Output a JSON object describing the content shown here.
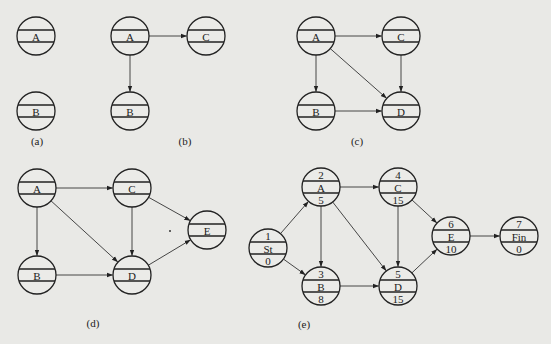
{
  "figures": [
    {
      "id": "a",
      "caption": "(a)",
      "nodes": [
        {
          "id": "A",
          "label": "A",
          "x": 36,
          "y": 36
        },
        {
          "id": "B",
          "label": "B",
          "x": 36,
          "y": 111
        }
      ],
      "edges": []
    },
    {
      "id": "b",
      "caption": "(b)",
      "nodes": [
        {
          "id": "A",
          "label": "A",
          "x": 130,
          "y": 36
        },
        {
          "id": "C",
          "label": "C",
          "x": 206,
          "y": 36
        },
        {
          "id": "B",
          "label": "B",
          "x": 130,
          "y": 111
        }
      ],
      "edges": [
        [
          "A",
          "C"
        ],
        [
          "A",
          "B"
        ]
      ]
    },
    {
      "id": "c",
      "caption": "(c)",
      "nodes": [
        {
          "id": "A",
          "label": "A",
          "x": 316,
          "y": 36
        },
        {
          "id": "C",
          "label": "C",
          "x": 401,
          "y": 36
        },
        {
          "id": "B",
          "label": "B",
          "x": 316,
          "y": 111
        },
        {
          "id": "D",
          "label": "D",
          "x": 401,
          "y": 111
        }
      ],
      "edges": [
        [
          "A",
          "C"
        ],
        [
          "A",
          "B"
        ],
        [
          "A",
          "D"
        ],
        [
          "B",
          "D"
        ],
        [
          "C",
          "D"
        ]
      ]
    },
    {
      "id": "d",
      "caption": "(d)",
      "nodes": [
        {
          "id": "A",
          "label": "A",
          "x": 37,
          "y": 188
        },
        {
          "id": "C",
          "label": "C",
          "x": 132,
          "y": 188
        },
        {
          "id": "E",
          "label": "E",
          "x": 207,
          "y": 230
        },
        {
          "id": "B",
          "label": "B",
          "x": 37,
          "y": 275
        },
        {
          "id": "D",
          "label": "D",
          "x": 132,
          "y": 275
        }
      ],
      "edges": [
        [
          "A",
          "C"
        ],
        [
          "A",
          "B"
        ],
        [
          "A",
          "D"
        ],
        [
          "B",
          "D"
        ],
        [
          "C",
          "D"
        ],
        [
          "C",
          "E"
        ],
        [
          "D",
          "E"
        ]
      ]
    },
    {
      "id": "e",
      "caption": "(e)",
      "nodes": [
        {
          "id": "1",
          "top": "1",
          "label": "St",
          "bottom": "0",
          "x": 268,
          "y": 248
        },
        {
          "id": "2",
          "top": "2",
          "label": "A",
          "bottom": "5",
          "x": 321,
          "y": 187
        },
        {
          "id": "3",
          "top": "3",
          "label": "B",
          "bottom": "8",
          "x": 321,
          "y": 286
        },
        {
          "id": "4",
          "top": "4",
          "label": "C",
          "bottom": "15",
          "x": 398,
          "y": 187
        },
        {
          "id": "5",
          "top": "5",
          "label": "D",
          "bottom": "15",
          "x": 398,
          "y": 286
        },
        {
          "id": "6",
          "top": "6",
          "label": "E",
          "bottom": "10",
          "x": 451,
          "y": 236
        },
        {
          "id": "7",
          "top": "7",
          "label": "Fin",
          "bottom": "0",
          "x": 519,
          "y": 236
        }
      ],
      "edges": [
        [
          "1",
          "2"
        ],
        [
          "1",
          "3"
        ],
        [
          "2",
          "4"
        ],
        [
          "2",
          "3"
        ],
        [
          "2",
          "5"
        ],
        [
          "3",
          "5"
        ],
        [
          "4",
          "5"
        ],
        [
          "4",
          "6"
        ],
        [
          "5",
          "6"
        ],
        [
          "6",
          "7"
        ]
      ]
    }
  ],
  "captions": [
    {
      "text": "(a)",
      "x": 37,
      "y": 145
    },
    {
      "text": "(b)",
      "x": 185,
      "y": 145
    },
    {
      "text": "(c)",
      "x": 357,
      "y": 145
    },
    {
      "text": "(d)",
      "x": 93,
      "y": 327
    },
    {
      "text": "(e)",
      "x": 304,
      "y": 328
    }
  ],
  "node_radius": 19
}
